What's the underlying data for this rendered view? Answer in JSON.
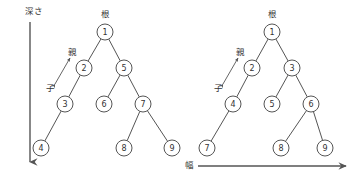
{
  "diagram": {
    "title_visible": false,
    "stroke_color": "#555555",
    "node_fill": "#ffffff",
    "text_color": "#333333",
    "labels": {
      "depth": "深さ",
      "breadth": "幅",
      "parent": "親",
      "child": "子",
      "root": "根"
    },
    "axes": [
      {
        "name": "depth-axis",
        "label": "深さ",
        "direction": "down",
        "x": 30,
        "y1": 22,
        "y2": 162
      },
      {
        "name": "breadth-axis",
        "label": "幅",
        "direction": "right",
        "y": 166,
        "x1": 198,
        "x2": 346
      }
    ],
    "trees": [
      {
        "name": "depth-first-tree",
        "root_label": "根",
        "parent_label": "親",
        "child_label": "子",
        "parent_label_pos": {
          "x": 72,
          "y": 52
        },
        "child_label_pos": {
          "x": 50,
          "y": 88
        },
        "root_label_pos": {
          "x": 105,
          "y": 14
        },
        "rel_arrow": {
          "x1": 55,
          "y1": 84,
          "x2": 70,
          "y2": 58
        },
        "nodes": [
          {
            "id": "1",
            "label": "1",
            "x": 105,
            "y": 32
          },
          {
            "id": "2",
            "label": "2",
            "x": 84,
            "y": 68
          },
          {
            "id": "5",
            "label": "5",
            "x": 124,
            "y": 68
          },
          {
            "id": "3",
            "label": "3",
            "x": 65,
            "y": 104
          },
          {
            "id": "6",
            "label": "6",
            "x": 104,
            "y": 104
          },
          {
            "id": "7",
            "label": "7",
            "x": 143,
            "y": 104
          },
          {
            "id": "4",
            "label": "4",
            "x": 41,
            "y": 148
          },
          {
            "id": "8",
            "label": "8",
            "x": 124,
            "y": 148
          },
          {
            "id": "9",
            "label": "9",
            "x": 172,
            "y": 148
          }
        ],
        "edges": [
          [
            "1",
            "2"
          ],
          [
            "1",
            "5"
          ],
          [
            "2",
            "3"
          ],
          [
            "5",
            "6"
          ],
          [
            "5",
            "7"
          ],
          [
            "3",
            "4"
          ],
          [
            "7",
            "8"
          ],
          [
            "7",
            "9"
          ]
        ]
      },
      {
        "name": "breadth-first-tree",
        "root_label": "根",
        "parent_label": "親",
        "child_label": "子",
        "parent_label_pos": {
          "x": 240,
          "y": 52
        },
        "child_label_pos": {
          "x": 218,
          "y": 88
        },
        "root_label_pos": {
          "x": 272,
          "y": 14
        },
        "rel_arrow": {
          "x1": 223,
          "y1": 84,
          "x2": 238,
          "y2": 58
        },
        "nodes": [
          {
            "id": "1",
            "label": "1",
            "x": 272,
            "y": 32
          },
          {
            "id": "2",
            "label": "2",
            "x": 252,
            "y": 68
          },
          {
            "id": "3",
            "label": "3",
            "x": 292,
            "y": 68
          },
          {
            "id": "4",
            "label": "4",
            "x": 233,
            "y": 104
          },
          {
            "id": "5",
            "label": "5",
            "x": 272,
            "y": 104
          },
          {
            "id": "6",
            "label": "6",
            "x": 311,
            "y": 104
          },
          {
            "id": "7",
            "label": "7",
            "x": 207,
            "y": 148
          },
          {
            "id": "8",
            "label": "8",
            "x": 281,
            "y": 148
          },
          {
            "id": "9",
            "label": "9",
            "x": 325,
            "y": 148
          }
        ],
        "edges": [
          [
            "1",
            "2"
          ],
          [
            "1",
            "3"
          ],
          [
            "2",
            "4"
          ],
          [
            "3",
            "5"
          ],
          [
            "3",
            "6"
          ],
          [
            "4",
            "7"
          ],
          [
            "6",
            "8"
          ],
          [
            "6",
            "9"
          ]
        ]
      }
    ],
    "node_radius": 8
  }
}
